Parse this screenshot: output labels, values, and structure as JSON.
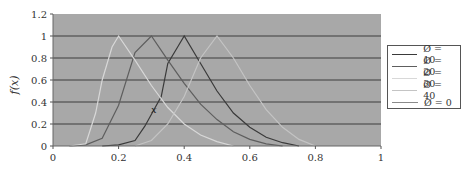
{
  "chart_data": {
    "type": "line",
    "title": "",
    "xlabel": "",
    "ylabel": "f(x)",
    "xlim": [
      0,
      1
    ],
    "ylim": [
      0,
      1.2
    ],
    "x_ticks": [
      "0",
      "0.2",
      "0.4",
      "0.6",
      "0.8",
      "1"
    ],
    "y_ticks": [
      "0",
      "0.2",
      "0.4",
      "0.6",
      "0.8",
      "1",
      "1.2"
    ],
    "grid": "horizontal",
    "legend_position": "right",
    "annotation": "x",
    "plot_background": "#a8a8a8",
    "series": [
      {
        "name": "Ø = 10",
        "color": "#3a3a3a",
        "points": [
          [
            0.15,
            0
          ],
          [
            0.2,
            0.01
          ],
          [
            0.25,
            0.05
          ],
          [
            0.28,
            0.18
          ],
          [
            0.33,
            0.45
          ],
          [
            0.35,
            0.75
          ],
          [
            0.38,
            0.9
          ],
          [
            0.4,
            1.0
          ],
          [
            0.45,
            0.75
          ],
          [
            0.5,
            0.5
          ],
          [
            0.55,
            0.3
          ],
          [
            0.6,
            0.17
          ],
          [
            0.65,
            0.08
          ],
          [
            0.7,
            0.03
          ],
          [
            0.75,
            0.0
          ]
        ]
      },
      {
        "name": "Ø = 20",
        "color": "#5e5e5e",
        "points": [
          [
            0.05,
            0
          ],
          [
            0.1,
            0.01
          ],
          [
            0.15,
            0.07
          ],
          [
            0.2,
            0.37
          ],
          [
            0.25,
            0.85
          ],
          [
            0.3,
            1.0
          ],
          [
            0.35,
            0.78
          ],
          [
            0.4,
            0.57
          ],
          [
            0.45,
            0.38
          ],
          [
            0.5,
            0.24
          ],
          [
            0.55,
            0.13
          ],
          [
            0.6,
            0.06
          ],
          [
            0.65,
            0.02
          ],
          [
            0.7,
            0.0
          ]
        ]
      },
      {
        "name": "Ø = 30",
        "color": "#d8d8d8",
        "points": [
          [
            0.05,
            0
          ],
          [
            0.1,
            0.02
          ],
          [
            0.13,
            0.3
          ],
          [
            0.15,
            0.6
          ],
          [
            0.18,
            0.9
          ],
          [
            0.2,
            1.0
          ],
          [
            0.25,
            0.78
          ],
          [
            0.3,
            0.55
          ],
          [
            0.35,
            0.35
          ],
          [
            0.4,
            0.2
          ],
          [
            0.45,
            0.1
          ],
          [
            0.5,
            0.04
          ],
          [
            0.55,
            0.0
          ]
        ]
      },
      {
        "name": "Ø = 40",
        "color": "#c4c4c4",
        "points": [
          [
            0.25,
            0
          ],
          [
            0.3,
            0.05
          ],
          [
            0.35,
            0.2
          ],
          [
            0.4,
            0.45
          ],
          [
            0.45,
            0.8
          ],
          [
            0.5,
            1.0
          ],
          [
            0.55,
            0.8
          ],
          [
            0.6,
            0.55
          ],
          [
            0.65,
            0.33
          ],
          [
            0.7,
            0.17
          ],
          [
            0.75,
            0.06
          ],
          [
            0.8,
            0.0
          ]
        ]
      },
      {
        "name": "Ø = 0",
        "color": "#8a8a8a",
        "points": []
      }
    ]
  }
}
